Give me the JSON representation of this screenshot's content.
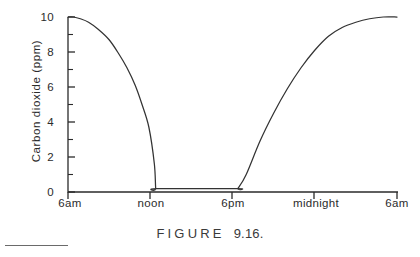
{
  "figure": {
    "caption_word": "FIGURE",
    "caption_number": "9.16."
  },
  "chart_data": {
    "type": "line",
    "title": "",
    "xlabel": "",
    "ylabel": "Carbon dioxide (ppm)",
    "ylim": [
      0,
      10
    ],
    "xlim": [
      0,
      24
    ],
    "grid": false,
    "legend": null,
    "y_ticks_major": [
      0,
      2,
      4,
      6,
      8,
      10
    ],
    "y_tick_labels": [
      "0",
      "2",
      "4",
      "6",
      "8",
      "10"
    ],
    "y_ticks_minor": [
      1,
      3,
      5,
      7,
      9
    ],
    "x_ticks": [
      0,
      6,
      12,
      18,
      24
    ],
    "x_tick_labels": [
      "6am",
      "noon",
      "6pm",
      "midnight",
      "6am"
    ],
    "series": [
      {
        "name": "Carbon dioxide",
        "x": [
          0.0,
          0.4,
          0.9,
          1.5,
          2.2,
          3.0,
          3.7,
          4.3,
          4.9,
          5.4,
          5.9,
          6.3,
          6.4,
          6.5,
          12.3,
          12.4,
          13.0,
          14.0,
          15.0,
          16.0,
          17.0,
          18.0,
          19.0,
          20.0,
          21.0,
          22.0,
          23.0,
          24.0
        ],
        "y": [
          10.0,
          10.0,
          9.9,
          9.7,
          9.3,
          8.7,
          7.9,
          7.1,
          6.1,
          5.0,
          3.7,
          1.6,
          0.2,
          0.2,
          0.2,
          0.2,
          1.0,
          2.9,
          4.5,
          5.9,
          7.1,
          8.1,
          8.9,
          9.4,
          9.7,
          9.9,
          10.0,
          10.0
        ]
      }
    ],
    "annotations": [
      "Curve is flat at 10 ppm at 6am, falls steeply to near 0 just after noon, stays flat at ~0.2 ppm until just after 6pm, then rises back to 10 ppm by 6am."
    ]
  },
  "colors": {
    "ink": "#2b2b2b",
    "curve": "#333333",
    "axis": "#2b2b2b",
    "background": "#ffffff"
  }
}
